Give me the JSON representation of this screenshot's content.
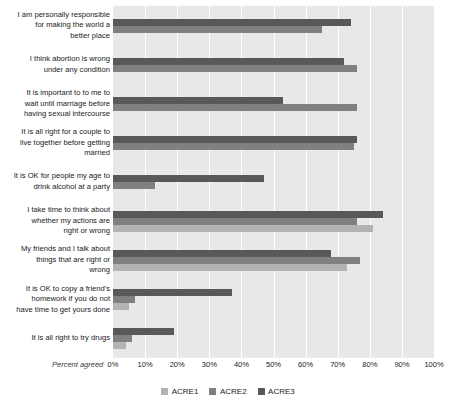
{
  "chart_data": {
    "type": "bar",
    "orientation": "horizontal",
    "title": "",
    "xlabel": "Percent agreed",
    "ylabel": "",
    "xlim": [
      0,
      100
    ],
    "xticks": [
      "0%",
      "10%",
      "20%",
      "30%",
      "40%",
      "50%",
      "60%",
      "70%",
      "80%",
      "90%",
      "100%"
    ],
    "grid": true,
    "legend_position": "bottom",
    "categories": [
      "I am personally responsible for making the world a better place",
      "I think abortion is wrong under any condition",
      "It is important to to me to wait until marriage before having sexual intercourse",
      "It is all right for a couple to live together before getting married",
      "It is OK for people my age to drink alcohol at a party",
      "I take time to think about whether my actions are right or wrong",
      "My friends and I talk about things that are right or wrong",
      "It is OK to copy a friend's homework if you do not have time to get yours done",
      "It is all right to try drugs"
    ],
    "category_lines": [
      [
        "I am personally responsible",
        "for making the world a",
        "better place"
      ],
      [
        "I think abortion is wrong",
        "under any condition"
      ],
      [
        "It is important to to me to",
        "wait until marriage before",
        "having sexual intercourse"
      ],
      [
        "It is all right for a couple to",
        "live together before getting",
        "married"
      ],
      [
        "It is OK for people my age to",
        "drink alcohol at a party"
      ],
      [
        "I take time to think about",
        "whether my actions are",
        "right or wrong"
      ],
      [
        "My friends and I talk about",
        "things that are right or",
        "wrong"
      ],
      [
        "It is OK to copy a friend's",
        "homework if you do not",
        "have time to get yours done"
      ],
      [
        "It is all right to try drugs"
      ]
    ],
    "series": [
      {
        "name": "ACRE1",
        "color": "#b3b3b3",
        "values": [
          null,
          null,
          null,
          null,
          null,
          81,
          73,
          5,
          4
        ]
      },
      {
        "name": "ACRE2",
        "color": "#808080",
        "values": [
          65,
          76,
          76,
          75,
          13,
          76,
          77,
          7,
          6
        ]
      },
      {
        "name": "ACRE3",
        "color": "#595959",
        "values": [
          74,
          72,
          53,
          76,
          47,
          84,
          68,
          37,
          19
        ]
      }
    ]
  },
  "legend": {
    "items": [
      {
        "label": "ACRE1",
        "key": "acre1"
      },
      {
        "label": "ACRE2",
        "key": "acre2"
      },
      {
        "label": "ACRE3",
        "key": "acre3"
      }
    ]
  },
  "colors": {
    "plot_background": "#e8e8e8",
    "gridline": "#ffffff",
    "acre1": "#b3b3b3",
    "acre2": "#808080",
    "acre3": "#595959",
    "text": "#1a1a1a"
  }
}
